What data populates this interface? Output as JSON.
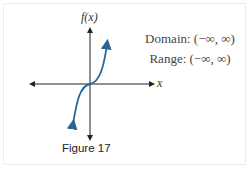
{
  "figure": {
    "caption": "Figure 17",
    "y_axis_label": "f(x)",
    "x_axis_label": "x",
    "domain_text": "Domain: (−∞, ∞)",
    "range_text": "Range: (−∞, ∞)",
    "curve_color": "#2a6496",
    "function": "cubic"
  }
}
